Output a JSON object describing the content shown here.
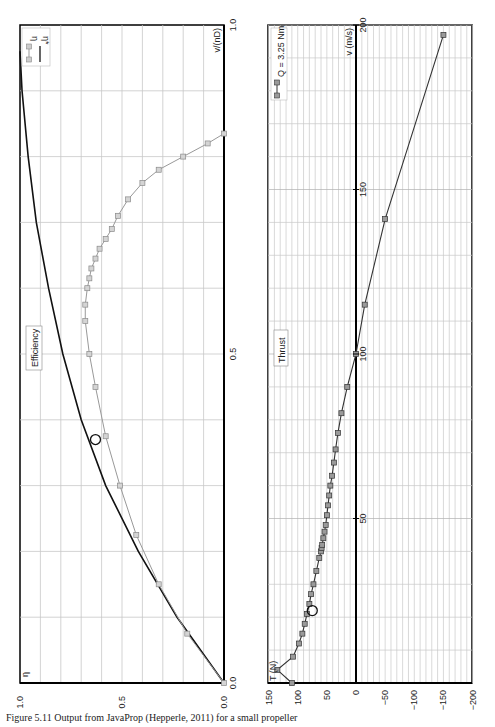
{
  "chart_data": [
    {
      "type": "line",
      "title": "Efficiency",
      "xlabel": "v/(nD)",
      "ylabel": "η",
      "xlim": [
        0.0,
        1.0
      ],
      "ylim": [
        0.0,
        1.0
      ],
      "x_ticks": [
        "0.0",
        "0.5",
        "1.0"
      ],
      "y_ticks": [
        "0.0",
        "0.5",
        "1.0"
      ],
      "grid": true,
      "legend": [
        "η",
        "η*"
      ],
      "orientation": "rotated 90° (x-axis vertical, η horizontal)",
      "series": [
        {
          "name": "η",
          "style": "gray line with square markers",
          "x": [
            0.0,
            0.075,
            0.15,
            0.225,
            0.3,
            0.375,
            0.45,
            0.5,
            0.55,
            0.575,
            0.6,
            0.615,
            0.63,
            0.645,
            0.66,
            0.675,
            0.69,
            0.71,
            0.735,
            0.76,
            0.78,
            0.8,
            0.82,
            0.835
          ],
          "values": [
            0.0,
            0.18,
            0.32,
            0.43,
            0.51,
            0.58,
            0.63,
            0.66,
            0.68,
            0.68,
            0.67,
            0.66,
            0.65,
            0.63,
            0.61,
            0.58,
            0.55,
            0.52,
            0.47,
            0.4,
            0.32,
            0.2,
            0.08,
            0.0
          ]
        },
        {
          "name": "η*",
          "style": "black solid line",
          "x": [
            0.0,
            0.1,
            0.2,
            0.3,
            0.4,
            0.5,
            0.6,
            0.7,
            0.8,
            0.9,
            0.96
          ],
          "values": [
            0.0,
            0.23,
            0.42,
            0.58,
            0.7,
            0.79,
            0.86,
            0.92,
            0.96,
            0.99,
            1.0
          ]
        }
      ],
      "annotations": [
        {
          "type": "circle",
          "x": 0.37,
          "y": 0.63
        }
      ]
    },
    {
      "type": "line",
      "title": "Thrust",
      "xlabel": "v (m/s)",
      "ylabel": "T (N)",
      "xlim": [
        0,
        200
      ],
      "ylim": [
        -200,
        150
      ],
      "x_ticks": [
        "0",
        "50",
        "100",
        "150",
        "200"
      ],
      "y_ticks": [
        "150",
        "100",
        "50",
        "0",
        "-50",
        "-100",
        "-150",
        "-200"
      ],
      "grid": true,
      "legend": [
        "Q = 3.25 Nm"
      ],
      "orientation": "rotated 90° (v vertical, T horizontal)",
      "series": [
        {
          "name": "Q = 3.25 Nm",
          "x": [
            0,
            4,
            8,
            12,
            15,
            18,
            21,
            24,
            27,
            30,
            34,
            38,
            40,
            41,
            42,
            44,
            46,
            48,
            51,
            54,
            57,
            60,
            63,
            67,
            71,
            76,
            82,
            90,
            100,
            115,
            141,
            197
          ],
          "values": [
            110,
            135,
            108,
            98,
            92,
            88,
            84,
            80,
            77,
            73,
            68,
            63,
            60,
            59,
            58,
            56,
            54,
            52,
            50,
            48,
            46,
            44,
            41,
            38,
            35,
            31,
            25,
            15,
            0,
            -15,
            -50,
            -150
          ]
        }
      ],
      "annotations": [
        {
          "type": "circle",
          "x": 22,
          "y": 75
        }
      ]
    }
  ],
  "charts": {
    "efficiency": {
      "title": "Efficiency",
      "x_axis_label": "v/(nD)",
      "y_axis_label": "η",
      "x_tick_0": "0.0",
      "x_tick_mid": "0.5",
      "x_tick_max": "1.0",
      "y_tick_0": "0.0",
      "y_tick_mid": "0.5",
      "y_tick_max": "1.0",
      "legend_eta": "η",
      "legend_eta_star": "η*"
    },
    "thrust": {
      "title": "Thrust",
      "x_axis_label": "v (m/s)",
      "y_axis_label": "T (N)",
      "legend": "Q = 3.25 Nm",
      "v_ticks": [
        "50",
        "100",
        "150",
        "200"
      ],
      "t_ticks": [
        "150",
        "100",
        "50",
        "0",
        "−50",
        "−100",
        "−150",
        "−200"
      ]
    }
  },
  "caption": "Figure 5.11  Output from JavaProp (Hepperle, 2011) for a small propeller"
}
